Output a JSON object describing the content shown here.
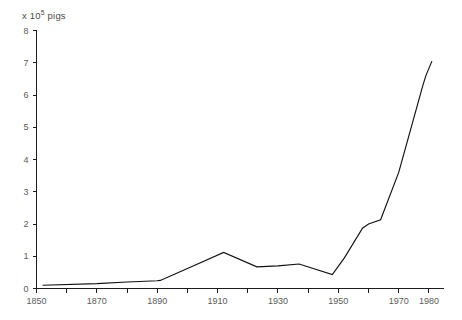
{
  "figure": {
    "background_color": "#ffffff",
    "axis_color": "#1c1c1c",
    "line_color": "#111111",
    "tick_label_color": "#5a5a5a",
    "unit_label_prefix": "x 10",
    "unit_label_exponent": "5",
    "unit_label_suffix": " pigs"
  },
  "chart_data": {
    "type": "line",
    "title": "",
    "subtitle": "",
    "xlabel": "",
    "ylabel": "x 10^5 pigs",
    "xlim": [
      1850,
      1985
    ],
    "ylim": [
      0,
      8
    ],
    "grid": false,
    "legend": null,
    "y_ticks": [
      0,
      1,
      2,
      3,
      4,
      5,
      6,
      7,
      8
    ],
    "y_tick_labels": [
      "0",
      "1",
      "2",
      "3",
      "4",
      "5",
      "6",
      "7",
      "8"
    ],
    "x_minor_ticks": [
      1850,
      1860,
      1870,
      1880,
      1890,
      1900,
      1910,
      1920,
      1930,
      1940,
      1950,
      1960,
      1970,
      1980
    ],
    "x_ticks": [
      1850,
      1870,
      1890,
      1910,
      1930,
      1950,
      1970,
      1980
    ],
    "x_tick_labels": [
      "1850",
      "1870",
      "1890",
      "1910",
      "1930",
      "1950",
      "1970",
      "1980"
    ],
    "series": [
      {
        "name": "pigs",
        "x": [
          1852,
          1870,
          1880,
          1890,
          1891,
          1900,
          1912,
          1923,
          1930,
          1937,
          1948,
          1952,
          1958,
          1960,
          1964,
          1970,
          1978,
          1979,
          1981
        ],
        "values": [
          0.1,
          0.15,
          0.2,
          0.24,
          0.25,
          0.62,
          1.12,
          0.67,
          0.7,
          0.76,
          0.43,
          0.95,
          1.87,
          2.0,
          2.13,
          3.6,
          6.3,
          6.6,
          7.05
        ]
      }
    ]
  }
}
